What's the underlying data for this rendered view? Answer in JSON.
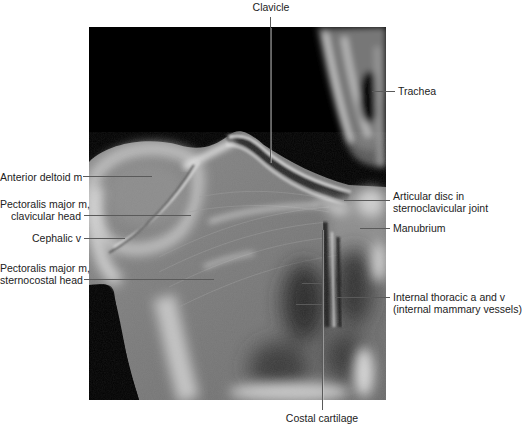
{
  "figure": {
    "type": "anatomical MRI, coronal/oblique section of anterior chest wall and shoulder",
    "labels": {
      "clavicle": "Clavicle",
      "trachea": "Trachea",
      "anterior_deltoid": "Anterior deltoid m",
      "pec_clavicular_line1": "Pectoralis major m,",
      "pec_clavicular_line2": "clavicular head",
      "cephalic": "Cephalic v",
      "pec_sternocostal_line1": "Pectoralis major m,",
      "pec_sternocostal_line2": "sternocostal head",
      "articular_disc_line1": "Articular disc in",
      "articular_disc_line2": "sternoclavicular joint",
      "manubrium": "Manubrium",
      "internal_thoracic_line1": "Internal thoracic a and v",
      "internal_thoracic_line2": "(internal mammary vessels)",
      "costal_cartilage": "Costal cartilage"
    },
    "colors": {
      "background": "#ffffff",
      "label_text": "#222222",
      "leader_line": "#555555",
      "image_frame": "#000000"
    }
  }
}
